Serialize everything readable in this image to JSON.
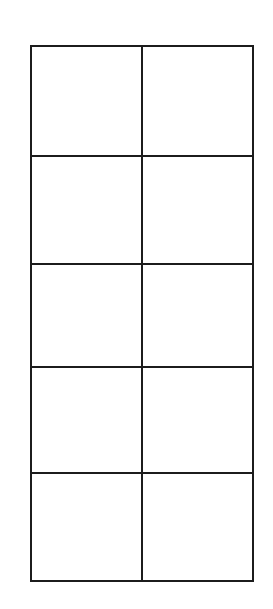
{
  "document": {
    "type": "scanned-page",
    "background_color": "#ffffff",
    "page_width": 273,
    "page_height": 609
  },
  "table": {
    "name": "blank-grid",
    "border_color": "#1c1c1c",
    "border_width_px": 2.6,
    "cell_background": "#ffffff",
    "columns": 2,
    "rows": 5,
    "has_header": false,
    "bounds": {
      "left": 30,
      "top": 45,
      "width": 222,
      "height": 535
    },
    "column_widths_px": [
      111,
      111
    ],
    "row_heights_px": [
      110,
      108,
      103,
      106,
      108
    ],
    "vertical_divider_x_px": [
      141
    ],
    "horizontal_divider_y_px": [
      155,
      263,
      366,
      472
    ],
    "cells": [
      [
        "",
        ""
      ],
      [
        "",
        ""
      ],
      [
        "",
        ""
      ],
      [
        "",
        ""
      ],
      [
        "",
        ""
      ]
    ]
  }
}
